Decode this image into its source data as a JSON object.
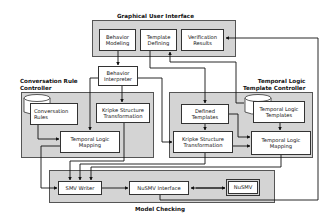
{
  "groups": {
    "gui": {
      "title": "Graphical User Interface"
    },
    "crc": {
      "title": "Conversation Rule\nController"
    },
    "tltc": {
      "title": "Temporal Logic\nTemplate Controller"
    },
    "mc": {
      "title": "Model Checking"
    }
  },
  "boxes": {
    "behavior_modeling": "Behavior\nModeling",
    "template_defining": "Template\nDefining",
    "verification_results": "Verification\nResults",
    "behavior_interpreter": "Behavior\nInterpreter",
    "conversation_rules": "Conversation\nRules",
    "kripke_left": "Kripke Structure\nTransformation",
    "tl_mapping_left": "Temporal Logic\nMapping",
    "defined_templates": "Defined\nTemplates",
    "tl_templates": "Temporal Logic\nTemplates",
    "kripke_right": "Kripke Structure\nTransformation",
    "tl_mapping_right": "Temporal Logic\nMapping",
    "smv_writer": "SMV Writer",
    "nusmv_interface": "NuSMV Interface",
    "nusmv": "NuSMV"
  }
}
